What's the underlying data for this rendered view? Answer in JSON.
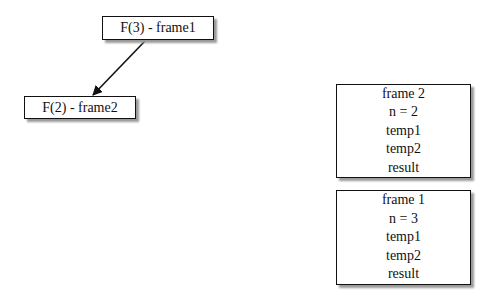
{
  "tree": {
    "nodes": [
      {
        "id": "f3",
        "label": "F(3) - frame1"
      },
      {
        "id": "f2",
        "label": "F(2) - frame2"
      }
    ],
    "edges": [
      {
        "from": "f3",
        "to": "f2"
      }
    ]
  },
  "stack": {
    "frames": [
      {
        "title": "frame 2",
        "lines": [
          "n = 2",
          "temp1",
          "temp2",
          "result"
        ]
      },
      {
        "title": "frame 1",
        "lines": [
          "n = 3",
          "temp1",
          "temp2",
          "result"
        ]
      }
    ]
  }
}
